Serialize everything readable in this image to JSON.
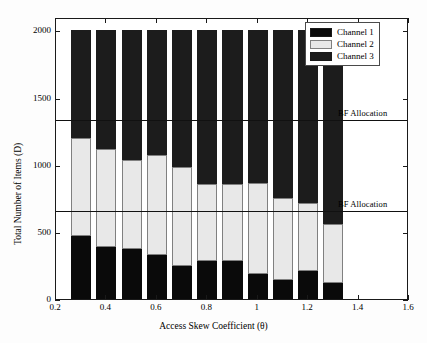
{
  "chart_data": {
    "type": "bar",
    "stacked": true,
    "title": "",
    "xlabel": "Access Skew Coefficient (θ)",
    "ylabel": "Total Number of Items (D)",
    "xlim": [
      0.2,
      1.6
    ],
    "ylim": [
      0,
      2100
    ],
    "xticks": [
      "0.2",
      "0.4",
      "0.6",
      "0.8",
      "1",
      "1.2",
      "1.4",
      "1.6"
    ],
    "xtick_values": [
      0.2,
      0.4,
      0.6,
      0.8,
      1.0,
      1.2,
      1.4,
      1.6
    ],
    "yticks": [
      "0",
      "500",
      "1000",
      "1500",
      "2000"
    ],
    "ytick_values": [
      0,
      500,
      1000,
      1500,
      2000
    ],
    "grid": false,
    "legend_position": "top-right",
    "categories": [
      0.3,
      0.4,
      0.5,
      0.6,
      0.7,
      0.8,
      0.9,
      1.0,
      1.1,
      1.2,
      1.3
    ],
    "series": [
      {
        "name": "Channel 1",
        "color": "#0a0a0a",
        "values": [
          470,
          390,
          370,
          325,
          245,
          285,
          285,
          185,
          145,
          205,
          120
        ]
      },
      {
        "name": "Channel 2",
        "color": "#e8e8e8",
        "values": [
          730,
          725,
          665,
          750,
          735,
          575,
          575,
          680,
          605,
          510,
          435
        ]
      },
      {
        "name": "Channel 3",
        "color": "#1c1c1c",
        "values": [
          800,
          885,
          965,
          925,
          1020,
          1140,
          1140,
          1135,
          1250,
          1285,
          1445
        ]
      }
    ],
    "totals": [
      2000,
      2000,
      2000,
      2000,
      2000,
      2000,
      2000,
      2000,
      2000,
      2000,
      2000
    ],
    "annotations": [
      {
        "label": "BF Allocation",
        "type": "hline",
        "y": 1350
      },
      {
        "label": "BF Allocation",
        "type": "hline",
        "y": 667
      }
    ]
  },
  "legend": {
    "items": [
      {
        "label": "Channel 1",
        "swatch": "c1"
      },
      {
        "label": "Channel 2",
        "swatch": "c2"
      },
      {
        "label": "Channel 3",
        "swatch": "c3"
      }
    ]
  }
}
